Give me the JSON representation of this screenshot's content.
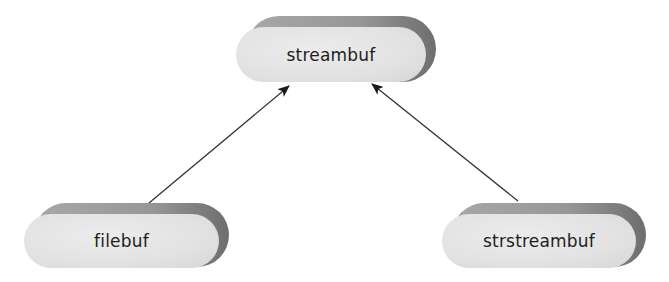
{
  "diagram": {
    "type": "class-inheritance",
    "nodes": [
      {
        "id": "streambuf",
        "label": "streambuf"
      },
      {
        "id": "filebuf",
        "label": "filebuf"
      },
      {
        "id": "strstreambuf",
        "label": "strstreambuf"
      }
    ],
    "edges": [
      {
        "from": "filebuf",
        "to": "streambuf",
        "arrow": "filled-triangle"
      },
      {
        "from": "strstreambuf",
        "to": "streambuf",
        "arrow": "filled-triangle"
      }
    ],
    "colors": {
      "node_face": "#e2e2e2",
      "node_band": "#979797",
      "node_shadow": "#6e6e6e",
      "edge": "#333333",
      "text": "#1e1e1e"
    }
  }
}
